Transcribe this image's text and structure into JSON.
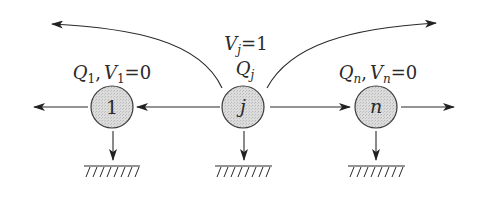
{
  "diagram": {
    "type": "network-flow-nodes",
    "colors": {
      "line": "#2a2a2a",
      "node_fill": "#d9d9d9",
      "node_stroke": "#3a3a3a",
      "background": "#ffffff"
    },
    "nodes": [
      {
        "id": "1",
        "label": "1",
        "italic": false,
        "annotation": {
          "q": "Q",
          "q_sub": "1",
          "sep": ",",
          "v": "V",
          "v_sub": "1",
          "eq": "=0"
        }
      },
      {
        "id": "j",
        "label": "j",
        "italic": true,
        "annotation_top": {
          "v": "V",
          "v_sub": "j",
          "eq": "=1"
        },
        "annotation": {
          "q": "Q",
          "q_sub": "j"
        }
      },
      {
        "id": "n",
        "label": "n",
        "italic": true,
        "annotation": {
          "q": "Q",
          "q_sub": "n",
          "sep": ",",
          "v": "V",
          "v_sub": "n",
          "eq": "=0"
        }
      }
    ],
    "edges": [
      {
        "from": "j",
        "to": "1",
        "style": "straight"
      },
      {
        "from": "j",
        "to": "n",
        "style": "straight"
      },
      {
        "from": "1",
        "to": "left-outside",
        "style": "straight"
      },
      {
        "from": "n",
        "to": "right-outside",
        "style": "straight"
      },
      {
        "from": "j",
        "to": "upper-left-outside",
        "style": "curved"
      },
      {
        "from": "j",
        "to": "upper-right-outside",
        "style": "curved"
      },
      {
        "from": "1",
        "to": "ground",
        "style": "straight-down"
      },
      {
        "from": "j",
        "to": "ground",
        "style": "straight-down"
      },
      {
        "from": "n",
        "to": "ground",
        "style": "straight-down"
      }
    ]
  }
}
